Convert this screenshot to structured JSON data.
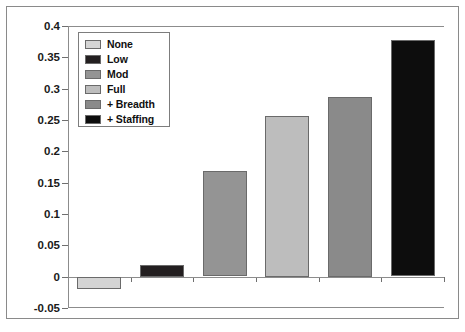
{
  "chart_data": {
    "type": "bar",
    "title": "",
    "xlabel": "",
    "ylabel": "",
    "categories": [
      "None",
      "Low",
      "Mod",
      "Full",
      "+ Breadth",
      "+ Staffing"
    ],
    "values": [
      -0.019,
      0.019,
      0.168,
      0.257,
      0.287,
      0.377
    ],
    "series": [
      {
        "name": "",
        "values": [
          -0.019,
          0.019,
          0.168,
          0.257,
          0.287,
          0.377
        ]
      }
    ],
    "ylim": [
      -0.05,
      0.4
    ],
    "ytick_labels": [
      "0.4",
      "0.35",
      "0.3",
      "0.25",
      "0.2",
      "0.15",
      "0.1",
      "0.05",
      "0",
      "-0.05"
    ],
    "ytick_values": [
      0.4,
      0.35,
      0.3,
      0.25,
      0.2,
      0.15,
      0.1,
      0.05,
      0,
      -0.05
    ],
    "xtick_labels": [
      "",
      "",
      "",
      "",
      "",
      ""
    ],
    "grid": false,
    "legend_position": "top-left",
    "legend": [
      {
        "label": "None",
        "color": "#d4d4d4"
      },
      {
        "label": "Low",
        "color": "#231f20"
      },
      {
        "label": "Mod",
        "color": "#949494"
      },
      {
        "label": "Full",
        "color": "#bdbdbd"
      },
      {
        "label": "+ Breadth",
        "color": "#8a8a8a"
      },
      {
        "label": "+ Staffing",
        "color": "#0d0d0d"
      }
    ],
    "colors": {
      "axis": "#8c8c8c",
      "bar_outline": "#6a6a6a",
      "text": "#1a1a1a",
      "background": "#ffffff",
      "frame": "#8a8a8a"
    }
  }
}
